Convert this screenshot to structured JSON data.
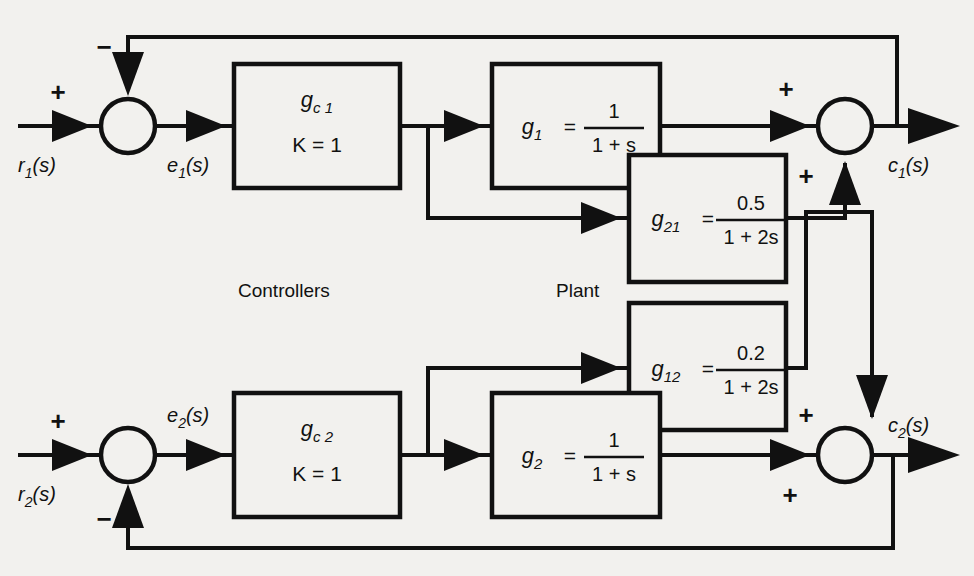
{
  "diagram": {
    "group_labels": {
      "controllers": "Controllers",
      "plant": "Plant"
    },
    "signals": {
      "r1": "r",
      "r1_sub": "1",
      "r1_tail": "(s)",
      "e1": "e",
      "e1_sub": "1",
      "e1_tail": "(s)",
      "c1": "c",
      "c1_sub": "1",
      "c1_tail": "(s)",
      "r2": "r",
      "r2_sub": "2",
      "r2_tail": "(s)",
      "e2": "e",
      "e2_sub": "2",
      "e2_tail": "(s)",
      "c2": "c",
      "c2_sub": "2",
      "c2_tail": "(s)"
    },
    "signs": {
      "sum1_plus": "+",
      "sum1_minus": "−",
      "sum2_plus": "+",
      "sum2_minus": "−",
      "sum3_plus_left": "+",
      "sum3_plus_bottom": "+",
      "sum4_plus_top": "+",
      "sum4_plus_left": "+"
    },
    "blocks": [
      {
        "id": "gc1",
        "name": "g",
        "name_sub": "c 1",
        "gain_label": "K  =  1",
        "kind": "controller"
      },
      {
        "id": "gc2",
        "name": "g",
        "name_sub": "c 2",
        "gain_label": "K  =  1",
        "kind": "controller"
      },
      {
        "id": "g1",
        "name": "g",
        "name_sub": "1",
        "equals": "=",
        "numerator": "1",
        "denominator": "1 + s",
        "kind": "plant-diagonal"
      },
      {
        "id": "g21",
        "name": "g",
        "name_sub": "21",
        "equals": "=",
        "numerator": "0.5",
        "denominator": "1 + 2s",
        "kind": "plant-coupling"
      },
      {
        "id": "g12",
        "name": "g",
        "name_sub": "12",
        "equals": "=",
        "numerator": "0.2",
        "denominator": "1 + 2s",
        "kind": "plant-coupling"
      },
      {
        "id": "g2",
        "name": "g",
        "name_sub": "2",
        "equals": "=",
        "numerator": "1",
        "denominator": "1 + s",
        "kind": "plant-diagonal"
      }
    ],
    "colors": {
      "line": "#111111",
      "background": "#f2f1ee",
      "block_fill": "#f2f1ee"
    }
  }
}
